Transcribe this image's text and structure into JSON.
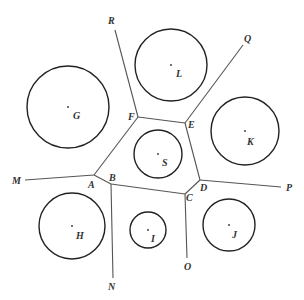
{
  "diagram": {
    "type": "voronoi-circles",
    "vertices": [
      {
        "id": "A",
        "x": 94,
        "y": 175,
        "label": "A",
        "lx": 88,
        "ly": 188
      },
      {
        "id": "B",
        "x": 111,
        "y": 184,
        "label": "B",
        "lx": 109,
        "ly": 181
      },
      {
        "id": "C",
        "x": 185,
        "y": 194,
        "label": "C",
        "lx": 186,
        "ly": 201
      },
      {
        "id": "D",
        "x": 200,
        "y": 180,
        "label": "D",
        "lx": 200,
        "ly": 191
      },
      {
        "id": "E",
        "x": 185,
        "y": 123,
        "label": "E",
        "lx": 188,
        "ly": 128
      },
      {
        "id": "F",
        "x": 138,
        "y": 117,
        "label": "F",
        "lx": 128,
        "ly": 120
      }
    ],
    "rays": [
      {
        "id": "M",
        "from": "A",
        "x": 25,
        "y": 180,
        "label": "M",
        "lx": 12,
        "ly": 184
      },
      {
        "id": "N",
        "from": "B",
        "x": 113,
        "y": 278,
        "label": "N",
        "lx": 108,
        "ly": 290
      },
      {
        "id": "O",
        "from": "C",
        "x": 187,
        "y": 258,
        "label": "O",
        "lx": 184,
        "ly": 270
      },
      {
        "id": "P",
        "from": "D",
        "x": 281,
        "y": 187,
        "label": "P",
        "lx": 286,
        "ly": 191
      },
      {
        "id": "Q",
        "from": "E",
        "x": 243,
        "y": 45,
        "label": "Q",
        "lx": 244,
        "ly": 42
      },
      {
        "id": "R",
        "from": "F",
        "x": 115,
        "y": 30,
        "label": "R",
        "lx": 108,
        "ly": 24
      }
    ],
    "cell_edges": [
      [
        "A",
        "B"
      ],
      [
        "B",
        "C"
      ],
      [
        "C",
        "D"
      ],
      [
        "D",
        "E"
      ],
      [
        "E",
        "F"
      ],
      [
        "F",
        "A"
      ]
    ],
    "circles": [
      {
        "id": "G",
        "cx": 68,
        "cy": 107,
        "r": 41,
        "label": "G",
        "lx": 73,
        "ly": 119
      },
      {
        "id": "L",
        "cx": 171,
        "cy": 65,
        "r": 36,
        "label": "L",
        "lx": 176,
        "ly": 77
      },
      {
        "id": "K",
        "cx": 245,
        "cy": 131,
        "r": 34,
        "label": "K",
        "lx": 247,
        "ly": 145
      },
      {
        "id": "S",
        "cx": 158,
        "cy": 154,
        "r": 24,
        "label": "S",
        "lx": 162,
        "ly": 166
      },
      {
        "id": "H",
        "cx": 72,
        "cy": 226,
        "r": 33,
        "label": "H",
        "lx": 76,
        "ly": 239
      },
      {
        "id": "I",
        "cx": 148,
        "cy": 230,
        "r": 18,
        "label": "I",
        "lx": 151,
        "ly": 242
      },
      {
        "id": "J",
        "cx": 229,
        "cy": 225,
        "r": 26,
        "label": "J",
        "lx": 232,
        "ly": 238
      }
    ]
  }
}
